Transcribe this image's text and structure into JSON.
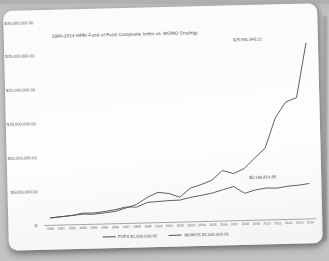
{
  "chart_data": {
    "type": "line",
    "title": "1990-2014 HFRI Fund of Fund Composite Index vs. MOMO Strategy",
    "x": [
      1990,
      1991,
      1992,
      1993,
      1994,
      1995,
      1996,
      1997,
      1998,
      1999,
      2000,
      2001,
      2002,
      2003,
      2004,
      2005,
      2006,
      2007,
      2008,
      2009,
      2010,
      2011,
      2012,
      2013,
      2014
    ],
    "ylim": [
      0,
      30000000
    ],
    "grid": false,
    "legend_position": "bottom-center",
    "line_color": "#515151",
    "yticks": [
      {
        "value": 0,
        "label": "$-"
      },
      {
        "value": 5000000,
        "label": "$5,000,000.00"
      },
      {
        "value": 10000000,
        "label": "$10,000,000.00"
      },
      {
        "value": 15000000,
        "label": "$15,000,000.00"
      },
      {
        "value": 20000000,
        "label": "$20,000,000.00"
      },
      {
        "value": 25000000,
        "label": "$25,000,000.00"
      },
      {
        "value": 30000000,
        "label": "$30,000,000.00"
      }
    ],
    "series": [
      {
        "name": "FOFS  $1,000,000.00",
        "end_label": "$5,166,614.68",
        "values": [
          1000000,
          1150000,
          1280000,
          1600000,
          1580000,
          1760000,
          2000000,
          2350000,
          2300000,
          2950000,
          3050000,
          3150000,
          3180000,
          3550000,
          3800000,
          4100000,
          4550000,
          5000000,
          3950000,
          4400000,
          4650000,
          4600000,
          4850000,
          4950000,
          5166614.68
        ]
      },
      {
        "name": "MOMOS  $1,000,000.00",
        "end_label": "$25,951,545.21",
        "values": [
          1000000,
          1150000,
          1300000,
          1450000,
          1400000,
          1560000,
          1750000,
          2200000,
          2700000,
          3700000,
          4400000,
          4200000,
          3600000,
          4900000,
          5400000,
          6000000,
          7400000,
          6900000,
          7600000,
          9100000,
          10600000,
          15000000,
          17300000,
          17900000,
          25951545.21
        ]
      }
    ]
  }
}
